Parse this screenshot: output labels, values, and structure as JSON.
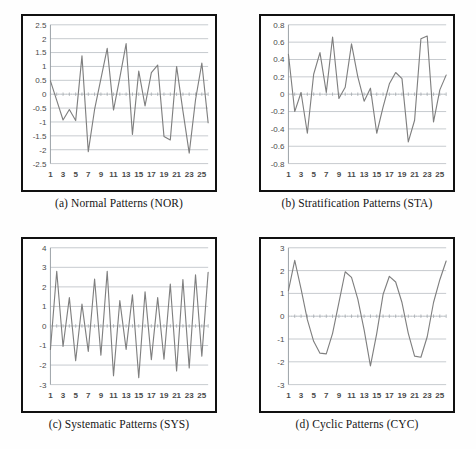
{
  "figure": {
    "line_color": "#7f7f7f",
    "grid_color": "#9fa6ad",
    "frame_color": "#111111"
  },
  "panels": [
    {
      "key": "a",
      "caption": "(a) Normal Patterns (NOR)",
      "chart_data": {
        "type": "line",
        "title": "(a) Normal Patterns (NOR)",
        "xlabel": "",
        "ylabel": "",
        "ylim": [
          -2.5,
          2.5
        ],
        "yticks": [
          2.5,
          2,
          1.5,
          1,
          0.5,
          0,
          -0.5,
          -1,
          -1.5,
          -2,
          -2.5
        ],
        "ytick_labels": [
          "2.5",
          "2",
          "1.5",
          "1",
          "0.5",
          "0",
          "-0.5",
          "-1",
          "-1.5",
          "-2",
          "-2.5"
        ],
        "xlim": [
          1,
          26
        ],
        "xticks": [
          1,
          3,
          5,
          7,
          9,
          11,
          13,
          15,
          17,
          19,
          21,
          23,
          25
        ],
        "xtick_labels": [
          "1",
          "3",
          "5",
          "7",
          "9",
          "11",
          "13",
          "15",
          "17",
          "19",
          "21",
          "23",
          "25"
        ],
        "grid": true,
        "legend": "none",
        "x": [
          1,
          2,
          3,
          4,
          5,
          6,
          7,
          8,
          9,
          10,
          11,
          12,
          13,
          14,
          15,
          16,
          17,
          18,
          19,
          20,
          21,
          22,
          23,
          24,
          25,
          26
        ],
        "values": [
          0.48,
          -0.22,
          -0.93,
          -0.55,
          -0.95,
          1.38,
          -2.07,
          -0.55,
          0.55,
          1.65,
          -0.57,
          0.6,
          1.82,
          -1.45,
          0.83,
          -0.42,
          0.78,
          1.05,
          -1.52,
          -1.65,
          1.0,
          -0.6,
          -2.12,
          -0.2,
          1.12,
          -1.03
        ],
        "series": [
          {
            "name": "NOR",
            "values": [
              0.48,
              -0.22,
              -0.93,
              -0.55,
              -0.95,
              1.38,
              -2.07,
              -0.55,
              0.55,
              1.65,
              -0.57,
              0.6,
              1.82,
              -1.45,
              0.83,
              -0.42,
              0.78,
              1.05,
              -1.52,
              -1.65,
              1.0,
              -0.6,
              -2.12,
              -0.2,
              1.12,
              -1.03
            ]
          }
        ]
      }
    },
    {
      "key": "b",
      "caption": "(b) Stratification Patterns (STA)",
      "chart_data": {
        "type": "line",
        "title": "(b) Stratification Patterns (STA)",
        "xlabel": "",
        "ylabel": "",
        "ylim": [
          -0.8,
          0.8
        ],
        "yticks": [
          0.8,
          0.6,
          0.4,
          0.2,
          0,
          -0.2,
          -0.4,
          -0.6,
          -0.8
        ],
        "ytick_labels": [
          "0.8",
          "0.6",
          "0.4",
          "0.2",
          "0",
          "-0.2",
          "-0.4",
          "-0.6",
          "-0.8"
        ],
        "xlim": [
          1,
          26
        ],
        "xticks": [
          1,
          3,
          5,
          7,
          9,
          11,
          13,
          15,
          17,
          19,
          21,
          23,
          25
        ],
        "xtick_labels": [
          "1",
          "3",
          "5",
          "7",
          "9",
          "11",
          "13",
          "15",
          "17",
          "19",
          "21",
          "23",
          "25"
        ],
        "grid": true,
        "legend": "none",
        "x": [
          1,
          2,
          3,
          4,
          5,
          6,
          7,
          8,
          9,
          10,
          11,
          12,
          13,
          14,
          15,
          16,
          17,
          18,
          19,
          20,
          21,
          22,
          23,
          24,
          25,
          26
        ],
        "values": [
          0.46,
          -0.2,
          0.02,
          -0.45,
          0.23,
          0.48,
          0.02,
          0.66,
          -0.05,
          0.08,
          0.58,
          0.2,
          -0.08,
          0.07,
          -0.45,
          -0.15,
          0.12,
          0.25,
          0.18,
          -0.55,
          -0.3,
          0.64,
          0.67,
          -0.32,
          0.05,
          0.22
        ],
        "series": [
          {
            "name": "STA",
            "values": [
              0.46,
              -0.2,
              0.02,
              -0.45,
              0.23,
              0.48,
              0.02,
              0.66,
              -0.05,
              0.08,
              0.58,
              0.2,
              -0.08,
              0.07,
              -0.45,
              -0.15,
              0.12,
              0.25,
              0.18,
              -0.55,
              -0.3,
              0.64,
              0.67,
              -0.32,
              0.05,
              0.22
            ]
          }
        ]
      }
    },
    {
      "key": "c",
      "caption": "(c) Systematic Patterns (SYS)",
      "chart_data": {
        "type": "line",
        "title": "(c) Systematic Patterns (SYS)",
        "xlabel": "",
        "ylabel": "",
        "ylim": [
          -3,
          4
        ],
        "yticks": [
          4,
          3,
          2,
          1,
          0,
          -1,
          -2,
          -3
        ],
        "ytick_labels": [
          "4",
          "3",
          "2",
          "1",
          "0",
          "-1",
          "-2",
          "-3"
        ],
        "xlim": [
          1,
          26
        ],
        "xticks": [
          1,
          3,
          5,
          7,
          9,
          11,
          13,
          15,
          17,
          19,
          21,
          23,
          25
        ],
        "xtick_labels": [
          "1",
          "3",
          "5",
          "7",
          "9",
          "11",
          "13",
          "15",
          "17",
          "19",
          "21",
          "23",
          "25"
        ],
        "grid": true,
        "legend": "none",
        "x": [
          1,
          2,
          3,
          4,
          5,
          6,
          7,
          8,
          9,
          10,
          11,
          12,
          13,
          14,
          15,
          16,
          17,
          18,
          19,
          20,
          21,
          22,
          23,
          24,
          25,
          26
        ],
        "values": [
          -1.2,
          2.8,
          -1.05,
          1.45,
          -1.78,
          1.12,
          -1.3,
          2.4,
          -1.5,
          2.8,
          -2.55,
          1.3,
          -1.2,
          1.6,
          -2.65,
          1.75,
          -1.72,
          1.45,
          -1.7,
          2.15,
          -2.3,
          2.38,
          -2.15,
          2.62,
          -1.55,
          2.75
        ],
        "series": [
          {
            "name": "SYS",
            "values": [
              -1.2,
              2.8,
              -1.05,
              1.45,
              -1.78,
              1.12,
              -1.3,
              2.4,
              -1.5,
              2.8,
              -2.55,
              1.3,
              -1.2,
              1.6,
              -2.65,
              1.75,
              -1.72,
              1.45,
              -1.7,
              2.15,
              -2.3,
              2.38,
              -2.15,
              2.62,
              -1.55,
              2.75
            ]
          }
        ]
      }
    },
    {
      "key": "d",
      "caption": "(d) Cyclic Patterns (CYC)",
      "chart_data": {
        "type": "line",
        "title": "(d) Cyclic Patterns (CYC)",
        "xlabel": "",
        "ylabel": "",
        "ylim": [
          -3,
          3
        ],
        "yticks": [
          3,
          2,
          1,
          0,
          -1,
          -2,
          -3
        ],
        "ytick_labels": [
          "3",
          "2",
          "1",
          "0",
          "-1",
          "-2",
          "-3"
        ],
        "xlim": [
          1,
          26
        ],
        "xticks": [
          1,
          3,
          5,
          7,
          9,
          11,
          13,
          15,
          17,
          19,
          21,
          23,
          25
        ],
        "xtick_labels": [
          "1",
          "3",
          "5",
          "7",
          "9",
          "11",
          "13",
          "15",
          "17",
          "19",
          "21",
          "23",
          "25"
        ],
        "grid": true,
        "legend": "none",
        "x": [
          1,
          2,
          3,
          4,
          5,
          6,
          7,
          8,
          9,
          10,
          11,
          12,
          13,
          14,
          15,
          16,
          17,
          18,
          19,
          20,
          21,
          22,
          23,
          24,
          25,
          26
        ],
        "values": [
          1.12,
          2.45,
          1.2,
          -0.15,
          -1.1,
          -1.62,
          -1.65,
          -0.75,
          0.6,
          1.95,
          1.7,
          0.75,
          -0.6,
          -2.18,
          -0.75,
          0.95,
          1.75,
          1.5,
          0.6,
          -0.75,
          -1.75,
          -1.8,
          -0.9,
          0.6,
          1.6,
          2.42
        ],
        "series": [
          {
            "name": "CYC",
            "values": [
              1.12,
              2.45,
              1.2,
              -0.15,
              -1.1,
              -1.62,
              -1.65,
              -0.75,
              0.6,
              1.95,
              1.7,
              0.75,
              -0.6,
              -2.18,
              -0.75,
              0.95,
              1.75,
              1.5,
              0.6,
              -0.75,
              -1.75,
              -1.8,
              -0.9,
              0.6,
              1.6,
              2.42
            ]
          }
        ]
      }
    }
  ]
}
